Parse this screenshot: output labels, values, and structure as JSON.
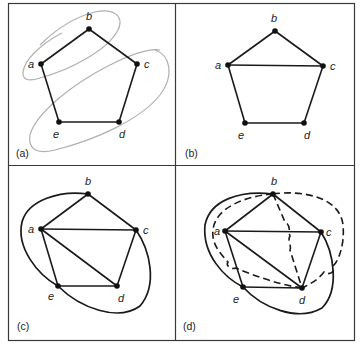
{
  "figure": {
    "panels": [
      {
        "id": "a",
        "label": "(a)",
        "vertices": [
          "a",
          "b",
          "c",
          "d",
          "e"
        ],
        "edges": [
          [
            "a",
            "b"
          ],
          [
            "b",
            "c"
          ],
          [
            "c",
            "d"
          ],
          [
            "d",
            "e"
          ],
          [
            "e",
            "a"
          ]
        ],
        "annotation": "two light gray loops: one around a–b, one around c–d–e"
      },
      {
        "id": "b",
        "label": "(b)",
        "vertices": [
          "a",
          "b",
          "c",
          "d",
          "e"
        ],
        "edges": [
          [
            "a",
            "b"
          ],
          [
            "b",
            "c"
          ],
          [
            "c",
            "d"
          ],
          [
            "d",
            "e"
          ],
          [
            "e",
            "a"
          ],
          [
            "a",
            "c"
          ]
        ]
      },
      {
        "id": "c",
        "label": "(c)",
        "vertices": [
          "a",
          "b",
          "c",
          "d",
          "e"
        ],
        "edges": [
          [
            "a",
            "b"
          ],
          [
            "b",
            "c"
          ],
          [
            "c",
            "d"
          ],
          [
            "d",
            "e"
          ],
          [
            "e",
            "a"
          ],
          [
            "a",
            "c"
          ],
          [
            "a",
            "d"
          ]
        ],
        "curved_edges": [
          [
            "b",
            "e"
          ],
          [
            "c",
            "e"
          ]
        ]
      },
      {
        "id": "d",
        "label": "(d)",
        "vertices": [
          "a",
          "b",
          "c",
          "d",
          "e"
        ],
        "edges": [
          [
            "a",
            "b"
          ],
          [
            "b",
            "c"
          ],
          [
            "c",
            "d"
          ],
          [
            "d",
            "e"
          ],
          [
            "e",
            "a"
          ],
          [
            "a",
            "c"
          ],
          [
            "a",
            "d"
          ]
        ],
        "curved_edges": [
          [
            "b",
            "e"
          ],
          [
            "c",
            "e"
          ]
        ],
        "dashed_edges": [
          [
            "b",
            "d"
          ],
          [
            "b",
            "d"
          ],
          [
            "b",
            "d"
          ]
        ]
      }
    ],
    "vertex_labels": {
      "a": "a",
      "b": "b",
      "c": "c",
      "d": "d",
      "e": "e"
    },
    "panel_labels": {
      "a": "(a)",
      "b": "(b)",
      "c": "(c)",
      "d": "(d)"
    }
  }
}
